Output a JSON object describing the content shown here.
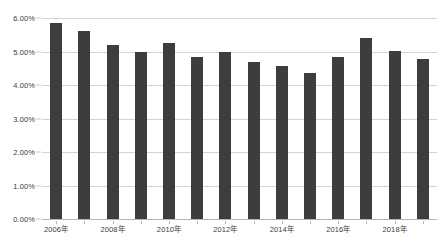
{
  "chart_data": {
    "type": "bar",
    "title": "",
    "subtitle": "",
    "xlabel": "",
    "ylabel": "",
    "categories": [
      "2006年",
      "2007年",
      "2008年",
      "2009年",
      "2010年",
      "2011年",
      "2012年",
      "2013年",
      "2014年",
      "2015年",
      "2016年",
      "2017年",
      "2018年",
      "2019年"
    ],
    "visible_tick_labels": [
      "2006年",
      "2008年",
      "2010年",
      "2012年",
      "2014年",
      "2016年",
      "2018年"
    ],
    "values": [
      5.85,
      5.6,
      5.2,
      4.98,
      5.25,
      4.83,
      5.0,
      4.7,
      4.57,
      4.35,
      4.85,
      5.4,
      5.02,
      4.77
    ],
    "value_labels": [
      "5.85%",
      "5.60%",
      "5.20%",
      "4.98%",
      "5.25%",
      "4.83%",
      "5.00%",
      "4.70%",
      "4.57%",
      "4.35%",
      "4.85%",
      "5.40%",
      "5.02%",
      "4.77%"
    ],
    "ylim": [
      0,
      6
    ],
    "ytick_values": [
      0,
      1,
      2,
      3,
      4,
      5,
      6
    ],
    "ytick_labels": [
      "0.00%",
      "1.00%",
      "2.00%",
      "3.00%",
      "4.00%",
      "5.00%",
      "6.00%"
    ],
    "grid": true,
    "grid_axis": "y",
    "legend": false,
    "legend_position": "none",
    "series": [
      {
        "name": "",
        "color": "#3d3d3d",
        "values": [
          5.85,
          5.6,
          5.2,
          4.98,
          5.25,
          4.83,
          5.0,
          4.7,
          4.57,
          4.35,
          4.85,
          5.4,
          5.02,
          4.77
        ]
      }
    ]
  },
  "colors": {
    "bar": "#3d3d3d",
    "gridline": "#d3d3d3",
    "axis": "#b5b5b5",
    "text": "#3b3b3b",
    "background": "#ffffff"
  }
}
